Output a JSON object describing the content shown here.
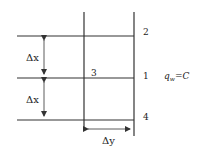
{
  "diagram": {
    "type": "finite-difference-grid",
    "nodes": [
      {
        "id": "n2",
        "label": "2"
      },
      {
        "id": "n3",
        "label": "3"
      },
      {
        "id": "n1",
        "label": "1"
      },
      {
        "id": "n4",
        "label": "4"
      }
    ],
    "dimensions": {
      "dx_top": "Δx",
      "dx_bottom": "Δx",
      "dy": "Δy"
    },
    "boundary_condition": {
      "symbol": "q",
      "subscript": "w",
      "relation": "=C"
    },
    "colors": {
      "line": "#333333",
      "text": "#222222",
      "background": "#ffffff"
    }
  }
}
